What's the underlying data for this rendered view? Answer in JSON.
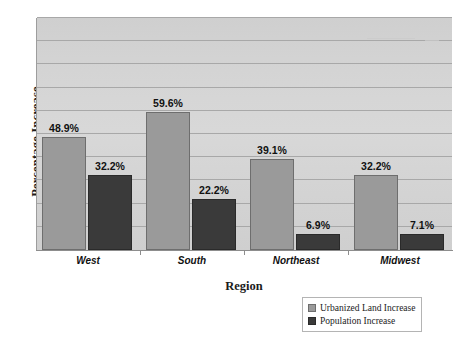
{
  "chart_data": {
    "type": "bar",
    "title": "",
    "xlabel": "Region",
    "ylabel": "Percentage Increase",
    "categories": [
      "West",
      "South",
      "Northeast",
      "Midwest"
    ],
    "series": [
      {
        "name": "Urbanized Land Increase",
        "color": "#9a9a9a",
        "values": [
          48.9,
          59.6,
          39.1,
          32.2
        ],
        "labels": [
          "48.9%",
          "59.6%",
          "39.1%",
          "32.2%"
        ]
      },
      {
        "name": "Population Increase",
        "color": "#3a3a3a",
        "values": [
          32.2,
          22.2,
          6.9,
          7.1
        ],
        "labels": [
          "32.2%",
          "22.2%",
          "6.9%",
          "7.1%"
        ]
      }
    ],
    "ylim": [
      0,
      100
    ],
    "grid": true,
    "y_tick_labels": [],
    "legend_position": "bottom-right",
    "plot_background": "#d4d4d4"
  },
  "axes": {
    "y_title": "Percentage Increase",
    "x_title": "Region"
  },
  "legend": {
    "entries": [
      {
        "label": "Urbanized Land Increase"
      },
      {
        "label": "Population Increase"
      }
    ]
  }
}
